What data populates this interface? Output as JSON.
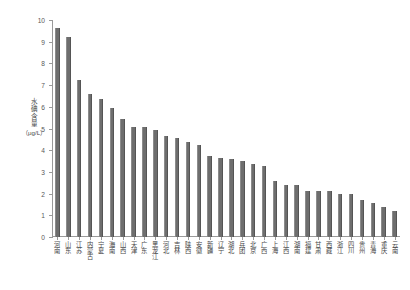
{
  "chart_data": {
    "type": "bar",
    "title": "",
    "xlabel": "",
    "ylabel": "水碘含量（μg/L）",
    "ylabel_text": "水碘含量",
    "ylabel_unit": "（μg/L）",
    "ylim": [
      0,
      10
    ],
    "yticks": [
      0,
      1,
      2,
      3,
      4,
      5,
      6,
      7,
      8,
      9,
      10
    ],
    "ytick_labels": [
      "0",
      "1",
      "2",
      "3",
      "4",
      "5",
      "6",
      "7",
      "8",
      "9",
      "10"
    ],
    "grid": false,
    "legend": null,
    "bar_color": "#6e6e6e",
    "categories": [
      "河南",
      "山东",
      "江苏",
      "内蒙古",
      "宁夏",
      "海南",
      "山西",
      "天津",
      "广东",
      "黑龙江",
      "河北",
      "吉林",
      "陕西",
      "安徽",
      "新疆",
      "辽宁",
      "湖北",
      "兵团",
      "北京",
      "广西",
      "上海",
      "江西",
      "湖南",
      "福建",
      "甘肃",
      "西藏",
      "浙江",
      "四川",
      "贵州",
      "青海",
      "重庆",
      "云南"
    ],
    "values": [
      9.65,
      9.2,
      7.25,
      6.6,
      6.35,
      5.95,
      5.45,
      5.05,
      5.05,
      4.95,
      4.65,
      4.55,
      4.4,
      4.25,
      3.75,
      3.65,
      3.6,
      3.5,
      3.35,
      3.25,
      2.6,
      2.4,
      2.4,
      2.1,
      2.1,
      2.1,
      2.0,
      2.0,
      1.7,
      1.55,
      1.4,
      1.2
    ]
  }
}
